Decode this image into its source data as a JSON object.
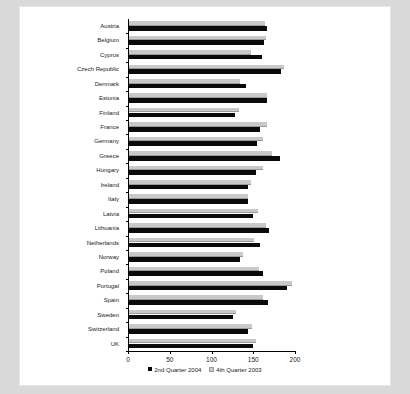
{
  "chart_data": {
    "type": "bar",
    "orientation": "horizontal",
    "title": "",
    "xlabel": "",
    "ylabel": "",
    "xlim": [
      0,
      200
    ],
    "xticks": [
      0,
      50,
      100,
      150,
      200
    ],
    "grid": false,
    "legend_position": "bottom",
    "categories": [
      "Austria",
      "Belgium",
      "Cyprus",
      "Czech Republic",
      "Denmark",
      "Estonia",
      "Finland",
      "France",
      "Germany",
      "Greece",
      "Hungary",
      "Ireland",
      "Italy",
      "Latvia",
      "Lithuania",
      "Netherlands",
      "Norway",
      "Poland",
      "Portugal",
      "Spain",
      "Sweden",
      "Switzerland",
      "UK"
    ],
    "series": [
      {
        "name": "2nd Quarter 2004",
        "color": "#0a0a0a",
        "values": [
          165,
          162,
          159,
          182,
          140,
          165,
          127,
          157,
          153,
          181,
          152,
          142,
          143,
          148,
          168,
          157,
          133,
          161,
          189,
          166,
          125,
          142,
          148
        ]
      },
      {
        "name": "4th Quarter 2003",
        "color": "#c9c9c9",
        "values": [
          163,
          164,
          146,
          186,
          133,
          165,
          132,
          165,
          160,
          171,
          161,
          146,
          143,
          155,
          164,
          150,
          137,
          156,
          195,
          160,
          128,
          147,
          152
        ]
      }
    ]
  },
  "legend": {
    "entries": [
      {
        "label": "2nd Quarter 2004"
      },
      {
        "label": "4th Quarter 2003"
      }
    ]
  }
}
